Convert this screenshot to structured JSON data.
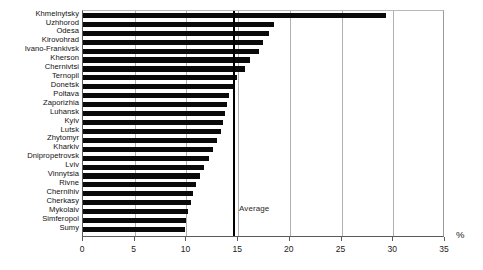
{
  "chart_data": {
    "type": "bar",
    "orientation": "horizontal",
    "title": "",
    "subtitle": "",
    "xlabel": "%",
    "ylabel": "",
    "xlim": [
      0,
      35
    ],
    "xticks": [
      0,
      5,
      10,
      15,
      20,
      25,
      30,
      35
    ],
    "grid": "vertical",
    "legend": "none",
    "categories": [
      "Khmelnytsky",
      "Uzhhorod",
      "Odesa",
      "Kirovohrad",
      "Ivano-Frankivsk",
      "Kherson",
      "Chernivtsi",
      "Ternopil",
      "Donetsk",
      "Poltava",
      "Zaporizhia",
      "Luhansk",
      "Kyiv",
      "Lutsk",
      "Zhytomyr",
      "Kharkiv",
      "Dnipropetrovsk",
      "Lviv",
      "Vinnytsia",
      "Rivne",
      "Chernihiv",
      "Cherkasy",
      "Mykolaiv",
      "Simferopol",
      "Sumy"
    ],
    "values": [
      29.3,
      18.5,
      18.0,
      17.4,
      17.0,
      16.1,
      15.7,
      14.9,
      14.5,
      14.1,
      13.9,
      13.7,
      13.5,
      13.3,
      13.0,
      12.6,
      12.2,
      11.7,
      11.3,
      10.9,
      10.6,
      10.4,
      10.2,
      10.0,
      9.9
    ],
    "annotations": [
      {
        "name": "average",
        "label": "Average",
        "value": 14.6
      }
    ]
  },
  "axis": {
    "unit_label": "%"
  },
  "colors": {
    "bar": "#0a0a0a",
    "grid": "#b0b0b0",
    "frame": "#5a5a5a",
    "average": "#000000",
    "background": "#ffffff"
  }
}
